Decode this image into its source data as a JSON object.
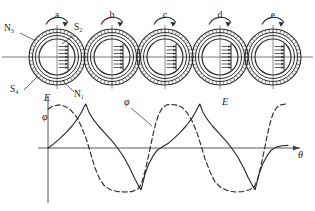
{
  "figure": {
    "type": "technical-diagram",
    "axis_x_label": "θ",
    "axis_y_label_top": "E",
    "axis_y_label_bottom": "φ"
  },
  "position_labels": [
    {
      "id": "a",
      "text": "a",
      "cx": 57
    },
    {
      "id": "b",
      "text": "b",
      "cx": 112
    },
    {
      "id": "c",
      "text": "c",
      "cx": 165
    },
    {
      "id": "d",
      "text": "d",
      "cx": 220
    },
    {
      "id": "e",
      "text": "e",
      "cx": 273
    }
  ],
  "pole_labels": [
    {
      "id": "n3",
      "text": "N₃",
      "x": 4,
      "y": 31
    },
    {
      "id": "s2",
      "text": "S₂",
      "x": 74,
      "y": 30
    },
    {
      "id": "s4",
      "text": "S₄",
      "x": 10,
      "y": 92
    },
    {
      "id": "n1",
      "text": "N₁",
      "x": 74,
      "y": 97
    }
  ],
  "curve_labels": [
    {
      "id": "e-axis",
      "text": "E",
      "x": 44,
      "y": 101
    },
    {
      "id": "phi-axis",
      "text": "φ",
      "x": 42,
      "y": 120
    },
    {
      "id": "phi-mid",
      "text": "φ",
      "x": 124,
      "y": 105
    },
    {
      "id": "e-mid",
      "text": "E",
      "x": 222,
      "y": 105
    },
    {
      "id": "theta",
      "text": "θ",
      "x": 298,
      "y": 158
    }
  ],
  "colors": {
    "ink": "#1c1c1c",
    "line": "#2b2b2b",
    "axis": "#444444",
    "background": "#ffffff"
  },
  "chart_data": {
    "type": "line",
    "title": "",
    "xlabel": "θ",
    "ylabel": "E, φ",
    "grid": false,
    "legend": "inline-annotations",
    "xlim": [
      0,
      2
    ],
    "ylim": [
      -1.15,
      1.15
    ],
    "series": [
      {
        "name": "E",
        "style": "solid",
        "description": "EMF: slow rise to sharp positive peak, steep decay through zero to sharp negative trough, repeating each cycle",
        "points": [
          [
            0.0,
            0.0
          ],
          [
            0.05,
            0.1
          ],
          [
            0.1,
            0.22
          ],
          [
            0.15,
            0.35
          ],
          [
            0.2,
            0.5
          ],
          [
            0.25,
            0.68
          ],
          [
            0.28,
            0.82
          ],
          [
            0.3,
            0.93
          ],
          [
            0.315,
            1.0
          ],
          [
            0.34,
            0.82
          ],
          [
            0.37,
            0.68
          ],
          [
            0.42,
            0.5
          ],
          [
            0.48,
            0.32
          ],
          [
            0.54,
            0.14
          ],
          [
            0.58,
            0.0
          ],
          [
            0.63,
            -0.2
          ],
          [
            0.68,
            -0.45
          ],
          [
            0.72,
            -0.68
          ],
          [
            0.755,
            -0.86
          ],
          [
            0.775,
            -0.95
          ],
          [
            0.79,
            -0.8
          ],
          [
            0.81,
            -0.58
          ],
          [
            0.84,
            -0.36
          ],
          [
            0.875,
            -0.18
          ],
          [
            0.91,
            -0.05
          ],
          [
            0.95,
            0.02
          ],
          [
            1.0,
            0.1
          ],
          [
            1.05,
            0.22
          ],
          [
            1.1,
            0.35
          ],
          [
            1.15,
            0.5
          ],
          [
            1.2,
            0.68
          ],
          [
            1.23,
            0.82
          ],
          [
            1.25,
            0.93
          ],
          [
            1.265,
            1.0
          ],
          [
            1.29,
            0.82
          ],
          [
            1.32,
            0.68
          ],
          [
            1.37,
            0.5
          ],
          [
            1.43,
            0.32
          ],
          [
            1.49,
            0.14
          ],
          [
            1.53,
            0.0
          ],
          [
            1.58,
            -0.2
          ],
          [
            1.63,
            -0.45
          ],
          [
            1.67,
            -0.68
          ],
          [
            1.705,
            -0.86
          ],
          [
            1.725,
            -0.95
          ],
          [
            1.74,
            -0.8
          ],
          [
            1.76,
            -0.58
          ],
          [
            1.79,
            -0.36
          ],
          [
            1.825,
            -0.18
          ],
          [
            1.86,
            -0.05
          ],
          [
            1.9,
            0.02
          ],
          [
            1.95,
            0.05
          ],
          [
            2.0,
            0.06
          ]
        ]
      },
      {
        "name": "φ",
        "style": "dashed",
        "description": "Flux: flat-topped positive plateau, steep fall to flat-bottomed negative plateau, quasi-trapezoidal, leading E",
        "points": [
          [
            0.0,
            0.88
          ],
          [
            0.04,
            0.95
          ],
          [
            0.09,
            0.98
          ],
          [
            0.14,
            0.95
          ],
          [
            0.19,
            0.86
          ],
          [
            0.24,
            0.7
          ],
          [
            0.28,
            0.48
          ],
          [
            0.32,
            0.2
          ],
          [
            0.355,
            -0.12
          ],
          [
            0.39,
            -0.44
          ],
          [
            0.43,
            -0.7
          ],
          [
            0.47,
            -0.86
          ],
          [
            0.52,
            -0.95
          ],
          [
            0.58,
            -0.99
          ],
          [
            0.64,
            -1.0
          ],
          [
            0.7,
            -0.99
          ],
          [
            0.745,
            -0.94
          ],
          [
            0.775,
            -0.84
          ],
          [
            0.8,
            -0.62
          ],
          [
            0.825,
            -0.34
          ],
          [
            0.85,
            -0.02
          ],
          [
            0.875,
            0.3
          ],
          [
            0.9,
            0.58
          ],
          [
            0.925,
            0.78
          ],
          [
            0.955,
            0.92
          ],
          [
            0.99,
            0.98
          ],
          [
            1.03,
            0.99
          ],
          [
            1.08,
            0.97
          ],
          [
            1.12,
            0.92
          ],
          [
            1.16,
            0.8
          ],
          [
            1.2,
            0.62
          ],
          [
            1.24,
            0.36
          ],
          [
            1.275,
            0.06
          ],
          [
            1.31,
            -0.26
          ],
          [
            1.35,
            -0.54
          ],
          [
            1.39,
            -0.76
          ],
          [
            1.44,
            -0.9
          ],
          [
            1.5,
            -0.97
          ],
          [
            1.56,
            -1.0
          ],
          [
            1.62,
            -0.99
          ],
          [
            1.68,
            -0.95
          ],
          [
            1.72,
            -0.88
          ],
          [
            1.75,
            -0.68
          ],
          [
            1.775,
            -0.4
          ],
          [
            1.8,
            -0.08
          ],
          [
            1.825,
            0.26
          ],
          [
            1.85,
            0.56
          ],
          [
            1.875,
            0.78
          ],
          [
            1.905,
            0.92
          ],
          [
            1.94,
            0.98
          ],
          [
            1.98,
            1.0
          ],
          [
            2.0,
            1.0
          ]
        ]
      }
    ]
  },
  "rotors": [
    {
      "id": "a",
      "cx": 57,
      "cy": 57
    },
    {
      "id": "b",
      "cx": 112,
      "cy": 57
    },
    {
      "id": "c",
      "cx": 165,
      "cy": 57
    },
    {
      "id": "d",
      "cx": 220,
      "cy": 57
    },
    {
      "id": "e",
      "cx": 273,
      "cy": 57
    }
  ]
}
